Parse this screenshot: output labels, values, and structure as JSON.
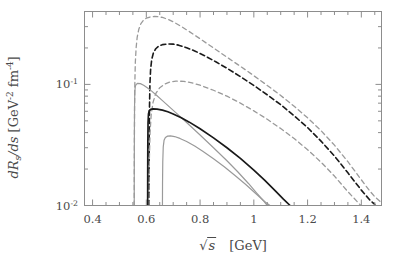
{
  "chart_data": {
    "type": "line",
    "title": "",
    "xlabel": "sqrt(s)  [GeV]",
    "ylabel": "dR_s/ds  [GeV^-2 fm^-4]",
    "xlabel_parts": {
      "symbol": "s",
      "unit": "[GeV]"
    },
    "ylabel_parts": {
      "numerator": "dR",
      "sub": "s",
      "denominator": "/ds",
      "unit_open": "[GeV",
      "unit_exp1": "-2",
      "unit_mid": " fm",
      "unit_exp2": "-4",
      "unit_close": "]"
    },
    "xscale": "linear",
    "yscale": "log",
    "xlim": [
      0.37,
      1.475
    ],
    "ylim": [
      0.01,
      0.4
    ],
    "grid": false,
    "legend": "none",
    "xticks": [
      0.4,
      0.6,
      0.8,
      1.0,
      1.2,
      1.4
    ],
    "xtick_labels": [
      "0.4",
      "0.6",
      "0.8",
      "1",
      "1.2",
      "1.4"
    ],
    "xminor_count_per_major": 4,
    "yticks": [
      0.01,
      0.1
    ],
    "ytick_labels": [
      "10",
      "10"
    ],
    "ytick_exponents": [
      "-2",
      "-1"
    ],
    "colors": {
      "black": "#1a1a1a",
      "gray": "#9a9a9a",
      "frame": "#8d8d8d",
      "text": "#4a4a4a"
    },
    "series": [
      {
        "name": "gray-dashed-upper",
        "color": "#9a9a9a",
        "style": "dashed",
        "width": 1.3,
        "points": [
          [
            0.555,
            0.01
          ],
          [
            0.5552,
            0.018
          ],
          [
            0.5556,
            0.034
          ],
          [
            0.5562,
            0.062
          ],
          [
            0.5572,
            0.1
          ],
          [
            0.559,
            0.15
          ],
          [
            0.562,
            0.2
          ],
          [
            0.566,
            0.245
          ],
          [
            0.572,
            0.285
          ],
          [
            0.58,
            0.318
          ],
          [
            0.59,
            0.34
          ],
          [
            0.6,
            0.352
          ],
          [
            0.615,
            0.361
          ],
          [
            0.63,
            0.364
          ],
          [
            0.645,
            0.362
          ],
          [
            0.66,
            0.357
          ],
          [
            0.68,
            0.345
          ],
          [
            0.7,
            0.329
          ],
          [
            0.73,
            0.301
          ],
          [
            0.76,
            0.273
          ],
          [
            0.8,
            0.238
          ],
          [
            0.85,
            0.2
          ],
          [
            0.9,
            0.168
          ],
          [
            0.95,
            0.141
          ],
          [
            1.0,
            0.118
          ],
          [
            1.05,
            0.098
          ],
          [
            1.1,
            0.081
          ],
          [
            1.15,
            0.066
          ],
          [
            1.2,
            0.053
          ],
          [
            1.25,
            0.0415
          ],
          [
            1.3,
            0.0315
          ],
          [
            1.35,
            0.023
          ],
          [
            1.4,
            0.0163
          ],
          [
            1.43,
            0.0133
          ],
          [
            1.45,
            0.0118
          ],
          [
            1.47,
            0.0108
          ]
        ]
      },
      {
        "name": "black-dashed-middle",
        "color": "#1a1a1a",
        "style": "dashed",
        "width": 1.6,
        "points": [
          [
            0.61,
            0.01
          ],
          [
            0.6103,
            0.019
          ],
          [
            0.6108,
            0.036
          ],
          [
            0.6118,
            0.065
          ],
          [
            0.6135,
            0.102
          ],
          [
            0.616,
            0.133
          ],
          [
            0.62,
            0.16
          ],
          [
            0.626,
            0.181
          ],
          [
            0.635,
            0.197
          ],
          [
            0.645,
            0.206
          ],
          [
            0.66,
            0.213
          ],
          [
            0.68,
            0.216
          ],
          [
            0.7,
            0.215
          ],
          [
            0.72,
            0.211
          ],
          [
            0.75,
            0.201
          ],
          [
            0.78,
            0.189
          ],
          [
            0.82,
            0.171
          ],
          [
            0.86,
            0.153
          ],
          [
            0.9,
            0.136
          ],
          [
            0.95,
            0.116
          ],
          [
            1.0,
            0.098
          ],
          [
            1.05,
            0.082
          ],
          [
            1.1,
            0.068
          ],
          [
            1.15,
            0.055
          ],
          [
            1.2,
            0.044
          ],
          [
            1.25,
            0.034
          ],
          [
            1.3,
            0.0256
          ],
          [
            1.35,
            0.0186
          ],
          [
            1.4,
            0.0134
          ],
          [
            1.43,
            0.0112
          ],
          [
            1.45,
            0.0102
          ]
        ]
      },
      {
        "name": "gray-dashed-lower",
        "color": "#9a9a9a",
        "style": "dashed",
        "width": 1.3,
        "points": [
          [
            0.61,
            0.01
          ],
          [
            0.6104,
            0.015
          ],
          [
            0.6115,
            0.025
          ],
          [
            0.614,
            0.04
          ],
          [
            0.618,
            0.056
          ],
          [
            0.625,
            0.071
          ],
          [
            0.635,
            0.084
          ],
          [
            0.65,
            0.094
          ],
          [
            0.67,
            0.101
          ],
          [
            0.69,
            0.105
          ],
          [
            0.71,
            0.1065
          ],
          [
            0.74,
            0.106
          ],
          [
            0.77,
            0.103
          ],
          [
            0.8,
            0.0985
          ],
          [
            0.85,
            0.0895
          ],
          [
            0.9,
            0.08
          ],
          [
            0.95,
            0.07
          ],
          [
            1.0,
            0.0605
          ],
          [
            1.05,
            0.0515
          ],
          [
            1.1,
            0.0432
          ],
          [
            1.15,
            0.0357
          ],
          [
            1.2,
            0.0289
          ],
          [
            1.25,
            0.0228
          ],
          [
            1.3,
            0.0175
          ],
          [
            1.35,
            0.013
          ],
          [
            1.4,
            0.0099
          ],
          [
            1.42,
            0.0095
          ]
        ]
      },
      {
        "name": "gray-solid-upper",
        "color": "#9a9a9a",
        "style": "solid",
        "width": 1.2,
        "points": [
          [
            0.555,
            0.01
          ],
          [
            0.5552,
            0.019
          ],
          [
            0.5556,
            0.037
          ],
          [
            0.5562,
            0.065
          ],
          [
            0.5572,
            0.087
          ],
          [
            0.559,
            0.096
          ],
          [
            0.562,
            0.1
          ],
          [
            0.568,
            0.102
          ],
          [
            0.578,
            0.1015
          ],
          [
            0.59,
            0.0985
          ],
          [
            0.605,
            0.0935
          ],
          [
            0.62,
            0.088
          ],
          [
            0.64,
            0.0805
          ],
          [
            0.66,
            0.0735
          ],
          [
            0.69,
            0.064
          ],
          [
            0.72,
            0.0558
          ],
          [
            0.76,
            0.0462
          ],
          [
            0.8,
            0.0382
          ],
          [
            0.85,
            0.03
          ],
          [
            0.9,
            0.0234
          ],
          [
            0.94,
            0.019
          ],
          [
            0.98,
            0.0152
          ],
          [
            1.01,
            0.0127
          ],
          [
            1.035,
            0.011
          ],
          [
            1.05,
            0.01
          ]
        ]
      },
      {
        "name": "black-solid-main",
        "color": "#1a1a1a",
        "style": "solid",
        "width": 1.7,
        "points": [
          [
            0.605,
            0.01
          ],
          [
            0.6052,
            0.018
          ],
          [
            0.6056,
            0.032
          ],
          [
            0.6064,
            0.048
          ],
          [
            0.608,
            0.057
          ],
          [
            0.611,
            0.0605
          ],
          [
            0.616,
            0.0622
          ],
          [
            0.625,
            0.0628
          ],
          [
            0.64,
            0.0625
          ],
          [
            0.66,
            0.0613
          ],
          [
            0.68,
            0.0594
          ],
          [
            0.7,
            0.057
          ],
          [
            0.73,
            0.053
          ],
          [
            0.76,
            0.0488
          ],
          [
            0.8,
            0.043
          ],
          [
            0.85,
            0.0362
          ],
          [
            0.9,
            0.03
          ],
          [
            0.95,
            0.0245
          ],
          [
            1.0,
            0.0196
          ],
          [
            1.04,
            0.0162
          ],
          [
            1.08,
            0.0132
          ],
          [
            1.11,
            0.0113
          ],
          [
            1.135,
            0.01
          ]
        ]
      },
      {
        "name": "gray-solid-lower",
        "color": "#9a9a9a",
        "style": "solid",
        "width": 1.2,
        "points": [
          [
            0.66,
            0.01
          ],
          [
            0.6603,
            0.015
          ],
          [
            0.6612,
            0.023
          ],
          [
            0.663,
            0.0305
          ],
          [
            0.666,
            0.0345
          ],
          [
            0.671,
            0.0365
          ],
          [
            0.679,
            0.0374
          ],
          [
            0.69,
            0.0376
          ],
          [
            0.705,
            0.0371
          ],
          [
            0.725,
            0.0358
          ],
          [
            0.75,
            0.0338
          ],
          [
            0.78,
            0.031
          ],
          [
            0.81,
            0.028
          ],
          [
            0.85,
            0.0243
          ],
          [
            0.89,
            0.0209
          ],
          [
            0.93,
            0.0177
          ],
          [
            0.97,
            0.0149
          ],
          [
            1.01,
            0.0124
          ],
          [
            1.04,
            0.0108
          ],
          [
            1.06,
            0.01
          ]
        ]
      }
    ]
  }
}
